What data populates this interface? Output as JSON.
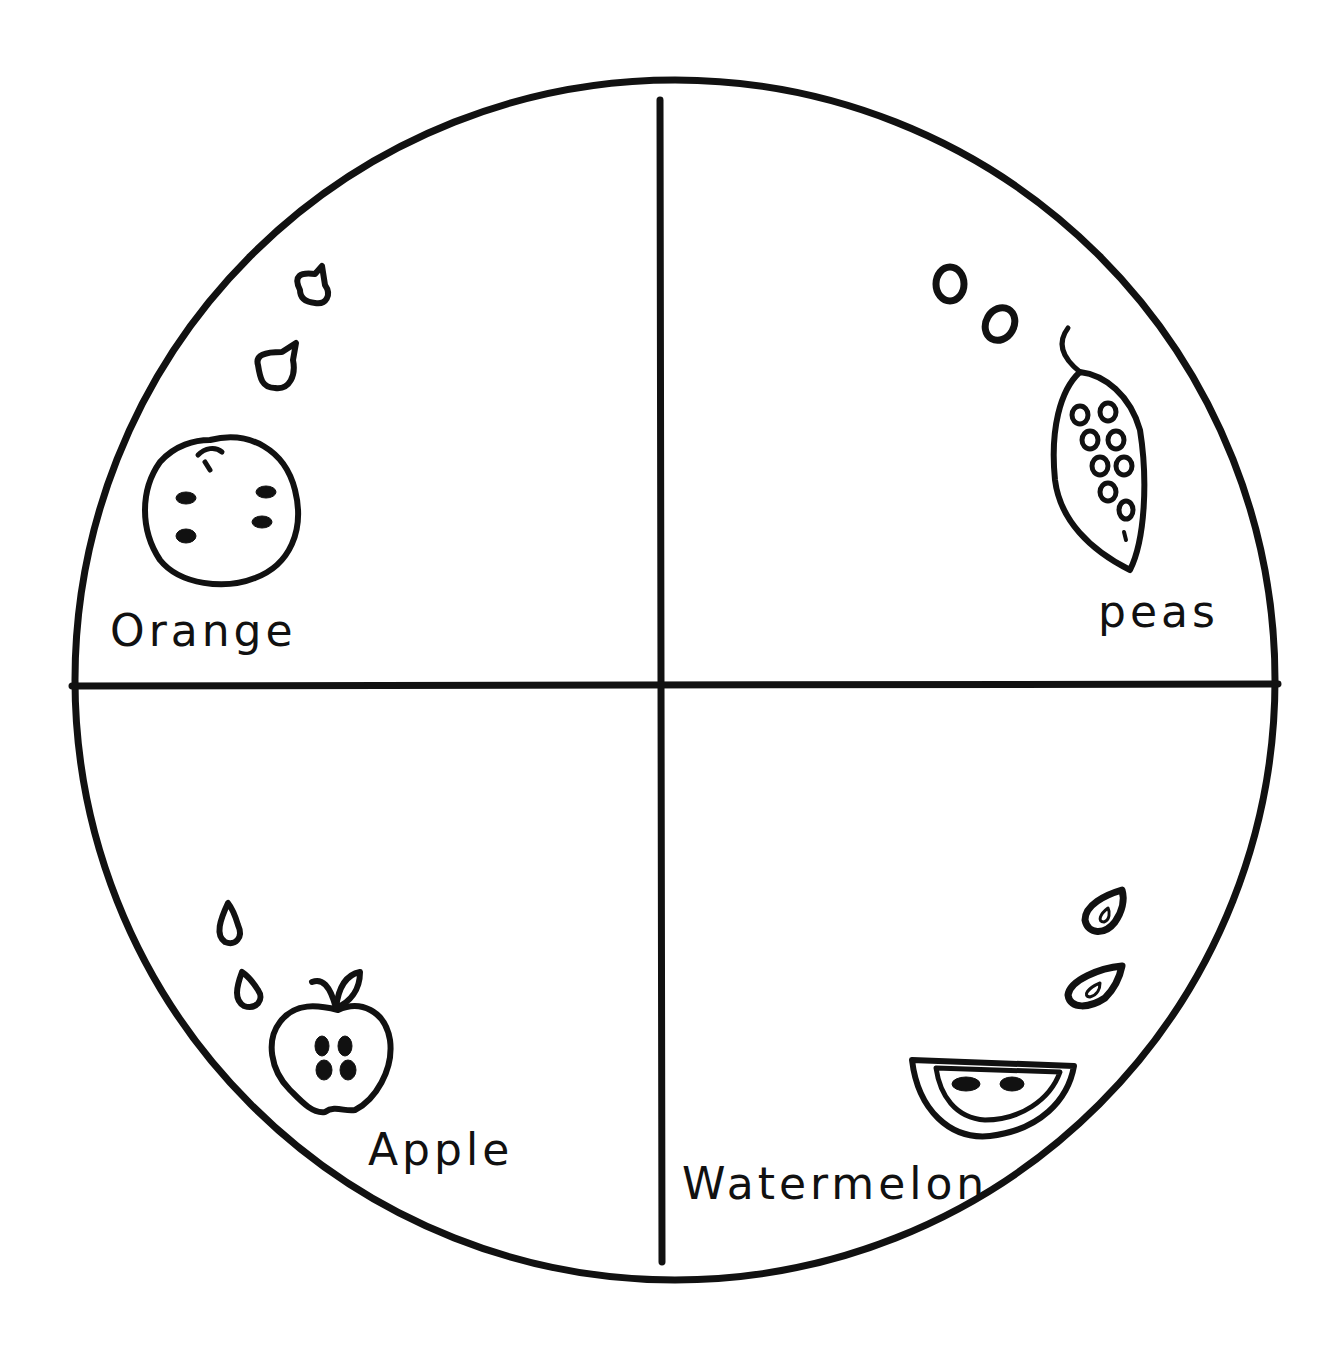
{
  "diagram": {
    "type": "four-quadrant circle",
    "colors": {
      "ink": "#111111",
      "background": "#ffffff"
    },
    "quadrants": [
      {
        "position": "top-left",
        "label": "Orange",
        "drawing": "orange with four seeds",
        "loose_seeds": 2
      },
      {
        "position": "top-right",
        "label": "peas",
        "drawing": "pea pod with nine peas",
        "loose_seeds": 2
      },
      {
        "position": "bottom-left",
        "label": "Apple",
        "drawing": "apple cut in half with four seeds",
        "loose_seeds": 2
      },
      {
        "position": "bottom-right",
        "label": "Watermelon",
        "drawing": "watermelon slice with two seeds",
        "loose_seeds": 2
      }
    ]
  }
}
